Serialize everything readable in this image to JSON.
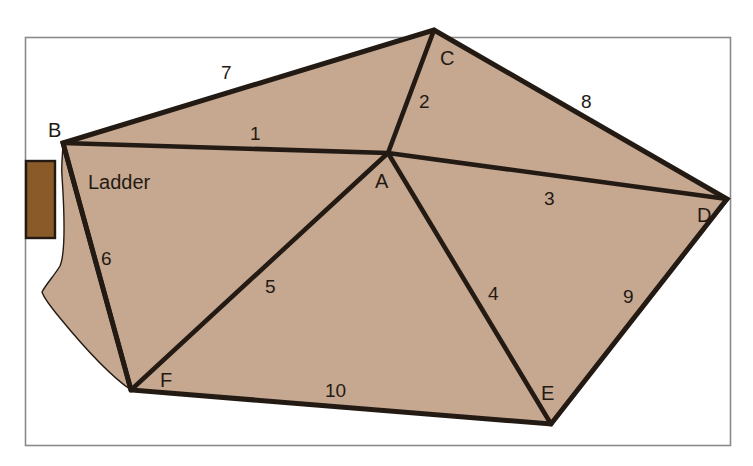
{
  "figure": {
    "title_present": false,
    "colors": {
      "surface_fill": "#c6a78f",
      "outline": "#231a14",
      "ladder_fill": "#8a5a29",
      "ladder_stroke": "#231a14",
      "frame_stroke": "#8a8a8a",
      "background": "#ffffff"
    },
    "annotations": [
      {
        "name": "ladder-label",
        "text": "Ladder",
        "x": 88,
        "y": 189
      }
    ],
    "vertices": [
      {
        "id": "A",
        "label": "A",
        "x": 388,
        "y": 153,
        "label_x": 375,
        "label_y": 188
      },
      {
        "id": "B",
        "label": "B",
        "x": 63,
        "y": 143,
        "label_x": 48,
        "label_y": 137
      },
      {
        "id": "C",
        "label": "C",
        "x": 434,
        "y": 30,
        "label_x": 440,
        "label_y": 65
      },
      {
        "id": "D",
        "label": "D",
        "x": 727,
        "y": 199,
        "label_x": 697,
        "label_y": 222
      },
      {
        "id": "E",
        "label": "E",
        "x": 551,
        "y": 424,
        "label_x": 541,
        "label_y": 400
      },
      {
        "id": "F",
        "label": "F",
        "x": 131,
        "y": 390,
        "label_x": 160,
        "label_y": 387
      }
    ],
    "edges": [
      {
        "id": "1",
        "label": "1",
        "from": "B",
        "to": "A",
        "label_x": 250,
        "label_y": 140,
        "kind": "interior"
      },
      {
        "id": "2",
        "label": "2",
        "from": "C",
        "to": "A",
        "label_x": 419,
        "label_y": 108,
        "kind": "interior"
      },
      {
        "id": "3",
        "label": "3",
        "from": "A",
        "to": "D",
        "label_x": 544,
        "label_y": 205,
        "kind": "interior"
      },
      {
        "id": "4",
        "label": "4",
        "from": "A",
        "to": "E",
        "label_x": 488,
        "label_y": 300,
        "kind": "interior"
      },
      {
        "id": "5",
        "label": "5",
        "from": "A",
        "to": "F",
        "label_x": 265,
        "label_y": 293,
        "kind": "interior"
      },
      {
        "id": "6",
        "label": "6",
        "from": "B",
        "to": "F",
        "label_x": 101,
        "label_y": 265,
        "kind": "interior"
      },
      {
        "id": "7",
        "label": "7",
        "from": "B",
        "to": "C",
        "label_x": 221,
        "label_y": 79,
        "kind": "boundary"
      },
      {
        "id": "8",
        "label": "8",
        "from": "C",
        "to": "D",
        "label_x": 581,
        "label_y": 108,
        "kind": "boundary"
      },
      {
        "id": "9",
        "label": "9",
        "from": "D",
        "to": "E",
        "label_x": 623,
        "label_y": 303,
        "kind": "boundary"
      },
      {
        "id": "10",
        "label": "10",
        "from": "F",
        "to": "E",
        "label_x": 325,
        "label_y": 397,
        "kind": "boundary"
      }
    ],
    "ladder_rect": {
      "x": 26,
      "y": 161,
      "width": 29,
      "height": 77
    },
    "frame": {
      "x": 25,
      "y": 37,
      "width": 705,
      "height": 408
    }
  }
}
